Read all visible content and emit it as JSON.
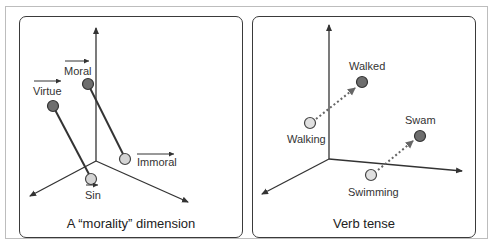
{
  "panels": [
    {
      "caption": "A “morality” dimension",
      "points": [
        {
          "label": "Virtue",
          "vector_arrow": true,
          "shade": "dark"
        },
        {
          "label": "Moral",
          "vector_arrow": true,
          "shade": "dark"
        },
        {
          "label": "Immoral",
          "vector_arrow": true,
          "shade": "light"
        },
        {
          "label": "Sin",
          "vector_arrow": true,
          "shade": "light"
        }
      ],
      "connections": [
        {
          "from": "Virtue",
          "to": "Sin",
          "style": "solid"
        },
        {
          "from": "Moral",
          "to": "Immoral",
          "style": "solid"
        }
      ]
    },
    {
      "caption": "Verb tense",
      "points": [
        {
          "label": "Walked",
          "shade": "dark"
        },
        {
          "label": "Walking",
          "shade": "light"
        },
        {
          "label": "Swam",
          "shade": "dark"
        },
        {
          "label": "Swimming",
          "shade": "light"
        }
      ],
      "connections": [
        {
          "from": "Walking",
          "to": "Walked",
          "style": "dotted-arrow"
        },
        {
          "from": "Swimming",
          "to": "Swam",
          "style": "dotted-arrow"
        }
      ]
    }
  ],
  "colors": {
    "dark_point": "#6e6e6e",
    "light_point": "#d4d4d4",
    "line": "#333333",
    "panel_border": "#3a3a3a",
    "outer_frame": "#bdbdbd"
  }
}
